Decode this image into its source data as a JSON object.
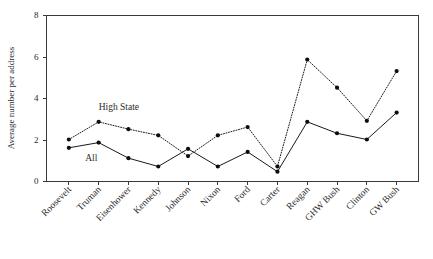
{
  "chart_data": {
    "type": "line",
    "title": "",
    "xlabel": "",
    "ylabel": "Average number per address",
    "ylim": [
      0,
      8
    ],
    "yticks": [
      0,
      2,
      4,
      6,
      8
    ],
    "grid": false,
    "legend_position": "inline-annotation",
    "categories": [
      "Roosevelt",
      "Truman",
      "Eisenhower",
      "Kennedy",
      "Johnson",
      "Nixon",
      "Ford",
      "Carter",
      "Reagan",
      "GHW Bush",
      "Clinton",
      "GW Bush"
    ],
    "series": [
      {
        "name": "High State",
        "style": "dotted",
        "values": [
          2.0,
          2.85,
          2.5,
          2.2,
          1.2,
          2.2,
          2.6,
          0.7,
          5.85,
          4.5,
          2.9,
          5.3
        ]
      },
      {
        "name": "All",
        "style": "solid",
        "values": [
          1.6,
          1.85,
          1.1,
          0.7,
          1.55,
          0.7,
          1.4,
          0.45,
          2.85,
          2.3,
          2.0,
          3.3
        ]
      }
    ],
    "annotations": [
      {
        "text": "High State",
        "x_value": 1.0,
        "y_value": 3.4
      },
      {
        "text": "All",
        "x_value": 0.55,
        "y_value": 0.95
      }
    ]
  },
  "axis": {
    "y_title": "Average number per address",
    "y_tick_labels": [
      "0",
      "2",
      "4",
      "6",
      "8"
    ]
  }
}
